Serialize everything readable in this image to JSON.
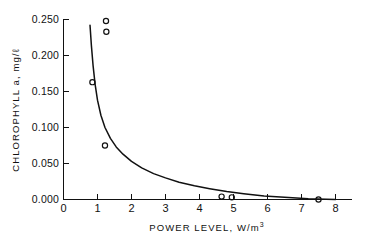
{
  "chart_data": {
    "type": "scatter",
    "title": "",
    "xlabel": "POWER LEVEL, W/m",
    "xlabel_sup": "3",
    "ylabel": "CHLOROPHYLL  a, mg/",
    "ylabel_unit_tail": "ℓ",
    "xlim": [
      0,
      8
    ],
    "ylim": [
      0.0,
      0.25
    ],
    "xticks": [
      0,
      1,
      2,
      3,
      4,
      5,
      6,
      7,
      8
    ],
    "xtick_labels": [
      "0",
      "1",
      "2",
      "3",
      "4",
      "5",
      "6",
      "7",
      "8"
    ],
    "yticks": [
      0.0,
      0.05,
      0.1,
      0.15,
      0.2,
      0.25
    ],
    "ytick_labels": [
      "0.000",
      "0.050",
      "0.100",
      "0.150",
      "0.200",
      "0.250"
    ],
    "grid": false,
    "legend": "none",
    "marker_style": "open-circle",
    "series": [
      {
        "name": "observations",
        "points": [
          {
            "x": 0.85,
            "y": 0.163
          },
          {
            "x": 1.25,
            "y": 0.248
          },
          {
            "x": 1.26,
            "y": 0.233
          },
          {
            "x": 1.22,
            "y": 0.075
          },
          {
            "x": 4.65,
            "y": 0.004
          },
          {
            "x": 4.95,
            "y": 0.003
          },
          {
            "x": 7.5,
            "y": 0.0
          }
        ]
      },
      {
        "name": "fitted-curve",
        "type": "line",
        "points": [
          {
            "x": 0.78,
            "y": 0.242
          },
          {
            "x": 0.82,
            "y": 0.214
          },
          {
            "x": 0.87,
            "y": 0.186
          },
          {
            "x": 0.93,
            "y": 0.16
          },
          {
            "x": 1.0,
            "y": 0.138
          },
          {
            "x": 1.1,
            "y": 0.117
          },
          {
            "x": 1.22,
            "y": 0.1
          },
          {
            "x": 1.38,
            "y": 0.085
          },
          {
            "x": 1.55,
            "y": 0.073
          },
          {
            "x": 1.75,
            "y": 0.063
          },
          {
            "x": 2.0,
            "y": 0.053
          },
          {
            "x": 2.3,
            "y": 0.044
          },
          {
            "x": 2.65,
            "y": 0.036
          },
          {
            "x": 3.0,
            "y": 0.03
          },
          {
            "x": 3.4,
            "y": 0.024
          },
          {
            "x": 3.85,
            "y": 0.019
          },
          {
            "x": 4.3,
            "y": 0.015
          },
          {
            "x": 4.8,
            "y": 0.011
          },
          {
            "x": 5.3,
            "y": 0.008
          },
          {
            "x": 5.9,
            "y": 0.005
          },
          {
            "x": 6.5,
            "y": 0.003
          },
          {
            "x": 7.2,
            "y": 0.001
          },
          {
            "x": 8.0,
            "y": 0.0
          }
        ]
      }
    ]
  },
  "figure": {
    "name": "chlorophyll-vs-power-level-plot",
    "background": "#ffffff",
    "ink_color": "#111111"
  }
}
